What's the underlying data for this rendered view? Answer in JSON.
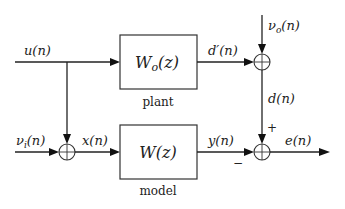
{
  "diagram": {
    "type": "block-diagram",
    "blocks": [
      {
        "id": "plant",
        "label": "W_o(z)",
        "text_main": "W",
        "text_sub": "o",
        "text_tail": "(z)",
        "caption": "plant"
      },
      {
        "id": "model",
        "label": "W(z)",
        "text_main": "W(z)",
        "caption": "model"
      }
    ],
    "signals": {
      "u": {
        "main": "u(n)"
      },
      "nu_i": {
        "main": "ν",
        "sub": "i",
        "tail": "(n)"
      },
      "x": {
        "main": "x(n)"
      },
      "d_prime": {
        "main": "d′(n)"
      },
      "nu_o": {
        "main": "ν",
        "sub": "o",
        "tail": "(n)"
      },
      "d": {
        "main": "d(n)"
      },
      "y": {
        "main": "y(n)"
      },
      "e": {
        "main": "e(n)"
      }
    },
    "summing_junctions": [
      {
        "id": "sum-input",
        "inputs": [
          "u(n)",
          "ν_i(n)"
        ],
        "output": "x(n)"
      },
      {
        "id": "sum-output-noise",
        "inputs": [
          "d′(n)",
          "ν_o(n)"
        ],
        "output": "d(n)"
      },
      {
        "id": "sum-error",
        "inputs": [
          "d(n)",
          "y(n)"
        ],
        "signs": [
          "+",
          "−"
        ],
        "output": "e(n)"
      }
    ],
    "signs": {
      "plus": "+",
      "minus": "−"
    }
  }
}
